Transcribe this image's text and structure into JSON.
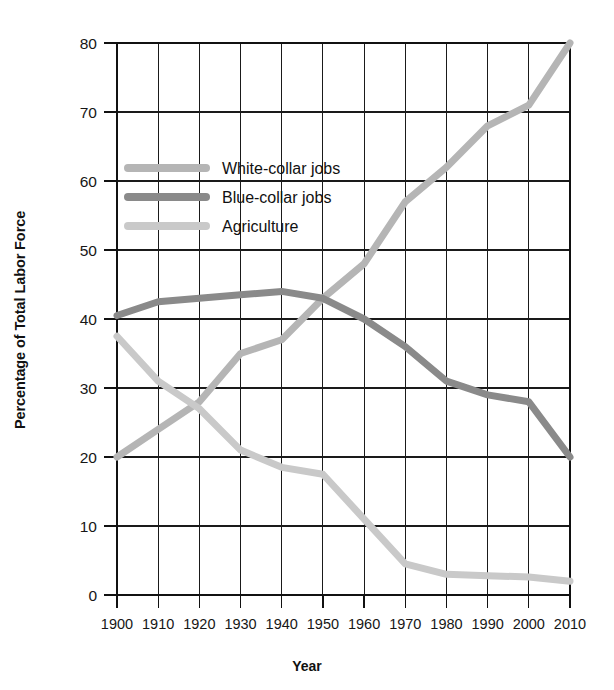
{
  "chart_data": {
    "type": "line",
    "title": "",
    "xlabel": "Year",
    "ylabel": "Percentage of Total Labor Force",
    "xlim": [
      1900,
      2010
    ],
    "ylim": [
      0,
      80
    ],
    "ytick_step": 10,
    "xtick_step": 10,
    "grid": true,
    "legend_position": "upper-left-inside",
    "x": [
      1900,
      1910,
      1920,
      1930,
      1940,
      1950,
      1960,
      1970,
      1980,
      1990,
      2000,
      2010
    ],
    "xticklabels": [
      "1900",
      "1910",
      "1920",
      "1930",
      "1940",
      "1950",
      "1960",
      "1970",
      "1980",
      "1990",
      "2000",
      "2010"
    ],
    "yticklabels": [
      "0",
      "10",
      "20",
      "30",
      "40",
      "50",
      "60",
      "70",
      "80"
    ],
    "yticks": [
      0,
      10,
      20,
      30,
      40,
      50,
      60,
      70,
      80
    ],
    "series": [
      {
        "name": "White-collar jobs",
        "color": "#b5b5b5",
        "values": [
          20,
          24,
          28,
          35,
          37,
          43,
          48,
          57,
          62,
          68,
          71,
          80
        ]
      },
      {
        "name": "Blue-collar jobs",
        "color": "#8a8a8a",
        "values": [
          40.5,
          42.5,
          43,
          43.5,
          44,
          43,
          40,
          36,
          31,
          29,
          28,
          20
        ]
      },
      {
        "name": "Agriculture",
        "color": "#c9c9c9",
        "values": [
          37.5,
          31,
          27,
          21,
          18.5,
          17.5,
          11,
          4.5,
          3,
          2.8,
          2.6,
          2
        ]
      }
    ]
  },
  "legend": {
    "items": [
      {
        "label": "White-collar jobs",
        "color": "#b5b5b5"
      },
      {
        "label": "Blue-collar jobs",
        "color": "#8a8a8a"
      },
      {
        "label": "Agriculture",
        "color": "#c9c9c9"
      }
    ]
  },
  "axes": {
    "x_title": "Year",
    "y_title": "Percentage of Total Labor Force"
  }
}
